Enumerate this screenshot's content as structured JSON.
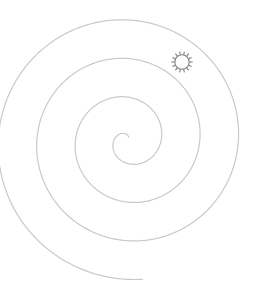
{
  "canvas": {
    "width": 266,
    "height": 291,
    "background_color": "#ffffff",
    "title": "Spiral with marker"
  },
  "figure": {
    "type": "line-drawing",
    "stroke_color": "#c9c9c9",
    "stroke_width": 1.2,
    "center_x": 128,
    "center_y": 140,
    "turns": 3.55,
    "start_angle_deg": -78,
    "inner_radius": 3,
    "outer_radius": 140,
    "direction": "counterclockwise",
    "bounds": {
      "left": 23,
      "right": 240,
      "top": 3,
      "bottom": 272
    }
  },
  "marker": {
    "name": "sun-marker",
    "shape": "sun",
    "center_x": 182,
    "center_y": 62,
    "radius": 7.2,
    "ray_count": 14,
    "ray_length": 3.4,
    "stroke_color": "#7d7d7d",
    "stroke_width": 1.1,
    "fill_color": "#ffffff"
  }
}
